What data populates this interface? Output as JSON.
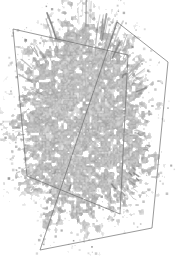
{
  "figure": {
    "type": "volume-rendering",
    "title": "3D volume rendering with two intersecting cutting planes",
    "width": 176,
    "height": 264,
    "background_color": "#ffffff"
  },
  "volume": {
    "name": "speckled-dendritic-volume",
    "description": "Dense granular grayscale isosurface cloud with ragged filamentary edges",
    "gray_min": "#6b6b6b",
    "gray_max": "#d2d2d2",
    "gray_mid": "#9a9a9a",
    "bounds": {
      "x": 14,
      "y": 26,
      "width": 148,
      "height": 185
    },
    "core": {
      "cx": 84,
      "cy": 120,
      "rx": 56,
      "ry": 84
    },
    "speckle_scale": 3.1,
    "filament_count": 150,
    "opacity": 0.95
  },
  "planes": [
    {
      "name": "plane-left-front",
      "stroke_color": "#6e6e6e",
      "stroke_width": 0.7,
      "corners": [
        {
          "label": "top-left",
          "x": 13,
          "y": 29
        },
        {
          "label": "top-right",
          "x": 128,
          "y": 55
        },
        {
          "label": "bottom-right",
          "x": 120,
          "y": 214
        },
        {
          "label": "bottom-left",
          "x": 27,
          "y": 176
        }
      ]
    },
    {
      "name": "plane-right-back",
      "stroke_color": "#6e6e6e",
      "stroke_width": 0.7,
      "corners": [
        {
          "label": "apex-top",
          "x": 117,
          "y": 22
        },
        {
          "label": "right-top",
          "x": 168,
          "y": 62
        },
        {
          "label": "bottom-right",
          "x": 152,
          "y": 228
        },
        {
          "label": "bottom-left",
          "x": 40,
          "y": 250
        }
      ]
    }
  ],
  "intersection": {
    "name": "plane-intersection-line",
    "top": {
      "x": 81,
      "y": 44
    },
    "bottom": {
      "x": 68,
      "y": 206
    }
  }
}
